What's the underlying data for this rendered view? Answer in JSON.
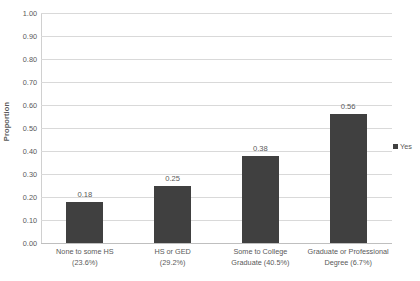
{
  "chart_data": {
    "type": "bar",
    "title": "",
    "subtitle": "",
    "xlabel": "",
    "ylabel": "Proportion",
    "ylim": [
      0.0,
      1.0
    ],
    "ytick_labels": [
      "0.00",
      "0.10",
      "0.20",
      "0.30",
      "0.40",
      "0.50",
      "0.60",
      "0.70",
      "0.80",
      "0.90",
      "1.00"
    ],
    "ytick_values": [
      0.0,
      0.1,
      0.2,
      0.3,
      0.4,
      0.5,
      0.6,
      0.7,
      0.8,
      0.9,
      1.0
    ],
    "grid": "horizontal",
    "legend_position": "right",
    "categories": [
      "None to some HS (23.6%)",
      "HS or GED (29.2%)",
      "Some to College Graduate (40.5%)",
      "Graduate or Professional Degree (6.7%)"
    ],
    "category_lines": [
      [
        "None to some HS",
        "(23.6%)"
      ],
      [
        "HS or GED",
        "(29.2%)"
      ],
      [
        "Some to College",
        "Graduate (40.5%)"
      ],
      [
        "Graduate or Professional",
        "Degree (6.7%)"
      ]
    ],
    "values": [
      0.18,
      0.25,
      0.38,
      0.56
    ],
    "value_labels": [
      "0.18",
      "0.25",
      "0.38",
      "0.56"
    ],
    "series": [
      {
        "name": "Yes",
        "color": "#404040",
        "values": [
          0.18,
          0.25,
          0.38,
          0.56
        ]
      }
    ],
    "legend": [
      {
        "label": "Yes",
        "color": "#404040"
      }
    ]
  },
  "colors": {
    "bar": "#404040",
    "gridline": "#d9d9d9",
    "axis": "#bfbfbf",
    "text": "#595959",
    "background": "#ffffff"
  }
}
